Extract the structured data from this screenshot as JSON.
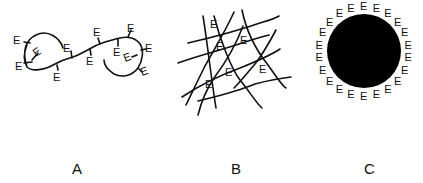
{
  "figure": {
    "panels": [
      {
        "id": "A",
        "label": "A",
        "description": "Flexible polymer chain with pendant E groups",
        "e_count": 12
      },
      {
        "id": "B",
        "label": "B",
        "description": "Cross-linked network with E groups in meshes",
        "e_count": 7
      },
      {
        "id": "C",
        "label": "C",
        "description": "Solid particle surface coated with E groups",
        "e_count": 22
      }
    ],
    "group_symbol": "E",
    "colors": {
      "ink": "#111111",
      "background": "#ffffff",
      "particle": "#000000"
    }
  }
}
